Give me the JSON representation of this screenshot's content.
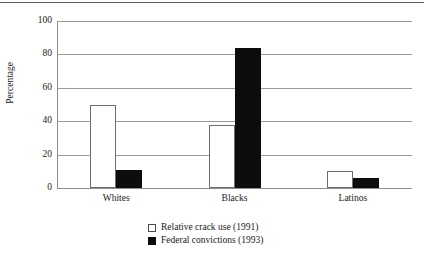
{
  "chart_data": {
    "type": "bar",
    "title": "",
    "subtitle": "",
    "xlabel": "",
    "ylabel": "Percentage",
    "categories": [
      "Whites",
      "Blacks",
      "Latinos"
    ],
    "series": [
      {
        "name": "Relative crack use (1991)",
        "swatch": "open",
        "color": "#ffffff",
        "values": [
          50,
          38,
          10
        ]
      },
      {
        "name": "Federal convictions (1993)",
        "swatch": "solid",
        "color": "#0d0d0d",
        "values": [
          11,
          84,
          6
        ]
      }
    ],
    "ylim": [
      0,
      100
    ],
    "yticks": [
      0,
      20,
      40,
      60,
      80,
      100
    ],
    "ytick_labels": [
      "0",
      "20",
      "40",
      "60",
      "80",
      "100"
    ],
    "grid": "horizontal",
    "legend_position": "bottom-center"
  },
  "figure": {
    "top_rule_color": "#5b5b5b",
    "gridline_color": "#9a9a9a",
    "axis_color": "#8d8d8d",
    "background": "#ffffff"
  }
}
